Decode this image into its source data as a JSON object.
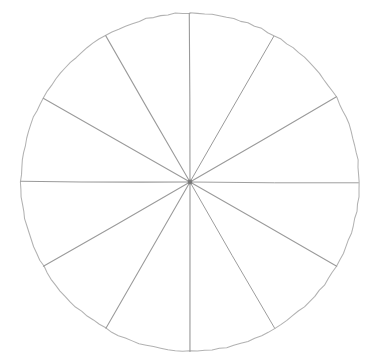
{
  "figure": {
    "style": "hand-drawn line diagram, thin light grey strokes on white",
    "background_color": "#ffffff",
    "canvas": {
      "width": 379,
      "height": 364
    }
  },
  "chart_data": {
    "type": "pie",
    "title": "",
    "subtitle": "",
    "xlabel": "",
    "ylabel": "",
    "legend_position": "none",
    "grid": false,
    "labels_shown": false,
    "values_shown": false,
    "slice_count": 12,
    "categories": [
      "1",
      "2",
      "3",
      "4",
      "5",
      "6",
      "7",
      "8",
      "9",
      "10",
      "11",
      "12"
    ],
    "values": [
      1,
      1,
      1,
      1,
      1,
      1,
      1,
      1,
      1,
      1,
      1,
      1
    ],
    "slice_fraction_each": "1/12",
    "slice_percent_each": 8.333,
    "slice_angle_degrees": 30,
    "shaded_slices": 0,
    "unshaded_slices": 12,
    "annotations": [],
    "geometry": {
      "center_x": 190,
      "center_y": 182,
      "radius": 169,
      "start_angle_degrees": -90,
      "divider_angles_degrees": [
        -90,
        -60,
        -30,
        0,
        30,
        60,
        90,
        120,
        150,
        180,
        210,
        240
      ]
    },
    "colors": {
      "slice_fill": "#ffffff",
      "divider_line": "#9a9a9a",
      "circle_outline": "#b2b2b2",
      "center_dot": "#6b6b6b"
    }
  },
  "geometry_readout": {
    "center_label": "centre",
    "radius_label": "radius",
    "sector_label": "sector",
    "divider_label": "radius divider"
  }
}
